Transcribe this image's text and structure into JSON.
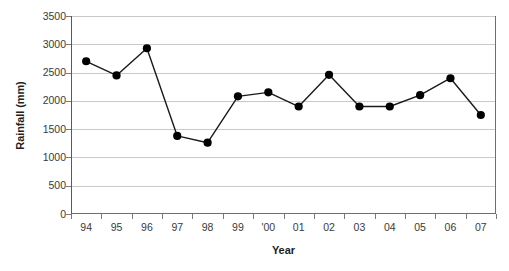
{
  "chart_data": {
    "type": "line",
    "title": "",
    "xlabel": "Year",
    "ylabel": "Rainfall (mm)",
    "categories": [
      "94",
      "95",
      "96",
      "97",
      "98",
      "99",
      "'00",
      "01",
      "02",
      "03",
      "04",
      "05",
      "06",
      "07"
    ],
    "values": [
      2700,
      2450,
      2930,
      1380,
      1260,
      2080,
      2150,
      1900,
      2460,
      1900,
      1900,
      2100,
      2400,
      1750
    ],
    "series": [
      {
        "name": "Rainfall",
        "values": [
          2700,
          2450,
          2930,
          1380,
          1260,
          2080,
          2150,
          1900,
          2460,
          1900,
          1900,
          2100,
          2400,
          1750
        ]
      }
    ],
    "ylim": [
      0,
      3500
    ],
    "y_ticks": [
      0,
      500,
      1000,
      1500,
      2000,
      2500,
      3000,
      3500
    ],
    "y_tick_labels": [
      "0",
      "500",
      "1000",
      "1500",
      "2000",
      "2500",
      "3000",
      "3500"
    ],
    "grid": true,
    "grid_axis": "y",
    "legend": false,
    "legend_position": "none",
    "marker": "filled-circle",
    "marker_color": "#000000",
    "line_color": "#1a1a1a",
    "gridline_color": "#c9c9c9",
    "axis_color": "#6e6e6e",
    "plot_background": "#ffffff",
    "figure_background": "#ffffff"
  },
  "axis": {
    "y_title": "Rainfall (mm)",
    "x_title": "Year"
  }
}
